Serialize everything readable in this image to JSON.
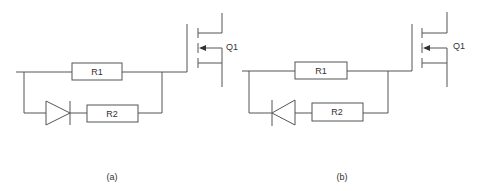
{
  "figure": {
    "panels": [
      {
        "id": "a",
        "caption": "(a)",
        "resistor_top": "R1",
        "resistor_bottom": "R2",
        "transistor": "Q1",
        "diode_direction": "forward (anode left, cathode right)"
      },
      {
        "id": "b",
        "caption": "(b)",
        "resistor_top": "R1",
        "resistor_bottom": "R2",
        "transistor": "Q1",
        "diode_direction": "reverse (cathode left, anode right)"
      }
    ]
  },
  "colors": {
    "line": "#555555",
    "text": "#333333",
    "background": "#ffffff"
  }
}
